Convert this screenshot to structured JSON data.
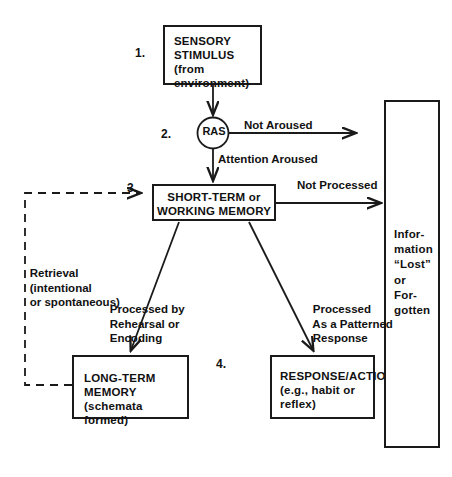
{
  "diagram": {
    "stroke_color": "#1a1a1a",
    "text_color": "#111111",
    "background": "#ffffff",
    "steps": {
      "one": "1.",
      "two": "2.",
      "three": "3.",
      "four": "4."
    },
    "nodes": {
      "sensory": {
        "line1": "SENSORY",
        "line2": "STIMULUS",
        "line3": "(from environment)"
      },
      "ras": {
        "label": "RAS"
      },
      "short_term": {
        "line1": "SHORT-TERM or",
        "line2": "WORKING MEMORY"
      },
      "long_term": {
        "line1": "LONG-TERM",
        "line2": "MEMORY",
        "line3": "(schemata formed)"
      },
      "response": {
        "line1": "RESPONSE/ACTION",
        "line2": "(e.g., habit or",
        "line3": "reflex)"
      },
      "information_lost": {
        "line1": "Infor-",
        "line2": "mation",
        "line3": "“Lost”",
        "line4": "or",
        "line5": "For-",
        "line6": "gotten"
      }
    },
    "edge_labels": {
      "not_aroused": "Not Aroused",
      "attention_aroused": "Attention Aroused",
      "not_processed": "Not Processed",
      "retrieval_l1": "Retrieval",
      "retrieval_l2": "(intentional",
      "retrieval_l3": "or spontaneous)",
      "rehearsal_l1": "Processed by",
      "rehearsal_l2": "Rehearsal or",
      "rehearsal_l3": "Encoding",
      "patterned_l1": "Processed",
      "patterned_l2": "As a Patterned",
      "patterned_l3": "Response"
    }
  }
}
